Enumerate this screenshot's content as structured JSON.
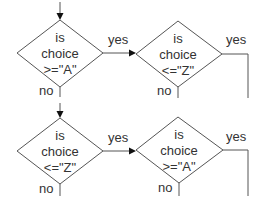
{
  "diagram": {
    "type": "flowchart",
    "nodes": [
      {
        "id": "d1",
        "shape": "diamond",
        "lines": [
          "is",
          "choice",
          ">=\"A\""
        ],
        "yes": "yes",
        "no": "no"
      },
      {
        "id": "d2",
        "shape": "diamond",
        "lines": [
          "is",
          "choice",
          "<=\"Z\""
        ],
        "yes": "yes",
        "no": "no"
      },
      {
        "id": "d3",
        "shape": "diamond",
        "lines": [
          "is",
          "choice",
          "<=\"Z\""
        ],
        "yes": "yes",
        "no": "no"
      },
      {
        "id": "d4",
        "shape": "diamond",
        "lines": [
          "is",
          "choice",
          ">=\"A\""
        ],
        "yes": "yes",
        "no": "no"
      }
    ],
    "edges": [
      {
        "from": "entry",
        "to": "d1",
        "label": ""
      },
      {
        "from": "d1",
        "to": "d2",
        "label": "yes"
      },
      {
        "from": "d1",
        "to": "below",
        "label": "no"
      },
      {
        "from": "d2",
        "to": "right-down",
        "label": "yes"
      },
      {
        "from": "d2",
        "to": "below",
        "label": "no"
      },
      {
        "from": "entry2",
        "to": "d3",
        "label": ""
      },
      {
        "from": "d3",
        "to": "d4",
        "label": "yes"
      },
      {
        "from": "d3",
        "to": "below",
        "label": "no"
      },
      {
        "from": "d4",
        "to": "right-down",
        "label": "yes"
      },
      {
        "from": "d4",
        "to": "below",
        "label": "no"
      }
    ]
  },
  "colors": {
    "stroke": "#555555",
    "arrow": "#111111",
    "text": "#333333",
    "background": "#ffffff"
  }
}
